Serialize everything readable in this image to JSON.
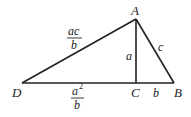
{
  "diagram": {
    "type": "geometry-triangle",
    "points": {
      "A": {
        "label": "A",
        "x": 136,
        "y": 19
      },
      "B": {
        "label": "B",
        "x": 174,
        "y": 83
      },
      "C": {
        "label": "C",
        "x": 136,
        "y": 83
      },
      "D": {
        "label": "D",
        "x": 22,
        "y": 83
      }
    },
    "segments": [
      {
        "from": "D",
        "to": "A"
      },
      {
        "from": "A",
        "to": "B"
      },
      {
        "from": "D",
        "to": "B"
      },
      {
        "from": "A",
        "to": "C"
      }
    ],
    "labels": {
      "AC": "a",
      "AB": "c",
      "CB": "b",
      "DA_num": "ac",
      "DA_den": "b",
      "DC_num": "a",
      "DC_sup": "2",
      "DC_den": "b"
    }
  }
}
